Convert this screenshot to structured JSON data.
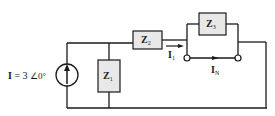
{
  "source": {
    "label_name": "I",
    "label_eq": "=",
    "magnitude": "3",
    "angle": "∠0°",
    "type": "current-source",
    "direction": "up"
  },
  "components": {
    "z1": {
      "name": "Z",
      "sub": "1"
    },
    "z2": {
      "name": "Z",
      "sub": "2"
    },
    "z3": {
      "name": "Z",
      "sub": "3"
    }
  },
  "currents": {
    "i1": {
      "name": "I",
      "sub": "1"
    },
    "in": {
      "name": "I",
      "sub": "N"
    }
  },
  "colors": {
    "wire": "#1a1a1a",
    "box_fill": "#e8e8e8",
    "background": "#ffffff"
  }
}
